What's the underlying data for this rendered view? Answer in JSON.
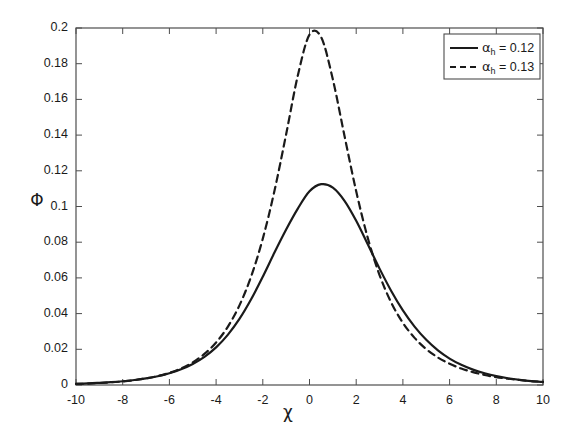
{
  "chart_data": {
    "type": "line",
    "title": "",
    "xlabel": "χ",
    "ylabel": "Φ",
    "xlim": [
      -10,
      10
    ],
    "ylim": [
      0,
      0.2
    ],
    "xticks": [
      -10,
      -8,
      -6,
      -4,
      -2,
      0,
      2,
      4,
      6,
      8,
      10
    ],
    "xtick_labels": [
      "-10",
      "-8",
      "-6",
      "-4",
      "-2",
      "0",
      "2",
      "4",
      "6",
      "8",
      "10"
    ],
    "yticks": [
      0,
      0.02,
      0.04,
      0.06,
      0.08,
      0.1,
      0.12,
      0.14,
      0.16,
      0.18,
      0.2
    ],
    "ytick_labels": [
      "0",
      "0.02",
      "0.04",
      "0.06",
      "0.08",
      "0.1",
      "0.12",
      "0.14",
      "0.16",
      "0.18",
      "0.2"
    ],
    "grid": false,
    "legend_position": "top-right",
    "line_color": "#1a1a1a",
    "series": [
      {
        "name": "α_h = 0.12",
        "style": "solid",
        "peak_x": 0.1,
        "peak_y": 0.113,
        "x": [
          -10,
          -9.5,
          -9,
          -8.5,
          -8,
          -7.5,
          -7,
          -6.5,
          -6,
          -5.5,
          -5,
          -4.5,
          -4,
          -3.5,
          -3,
          -2.5,
          -2,
          -1.5,
          -1,
          -0.5,
          0,
          0.5,
          1,
          1.5,
          2,
          2.5,
          3,
          3.5,
          4,
          4.5,
          5,
          5.5,
          6,
          6.5,
          7,
          7.5,
          8,
          8.5,
          9,
          9.5,
          10
        ],
        "y": [
          0.0007,
          0.0009,
          0.0012,
          0.0016,
          0.0021,
          0.0028,
          0.0037,
          0.0049,
          0.0066,
          0.0088,
          0.0118,
          0.0158,
          0.0211,
          0.0281,
          0.037,
          0.048,
          0.0607,
          0.0742,
          0.0871,
          0.0988,
          0.1085,
          0.1125,
          0.1106,
          0.1032,
          0.092,
          0.0787,
          0.0652,
          0.0527,
          0.0418,
          0.0327,
          0.0253,
          0.0194,
          0.0148,
          0.0113,
          0.0086,
          0.0066,
          0.005,
          0.0038,
          0.0029,
          0.0022,
          0.0017
        ]
      },
      {
        "name": "α_h = 0.13",
        "style": "dashed",
        "peak_x": 0.0,
        "peak_y": 0.196,
        "x": [
          -10,
          -9.5,
          -9,
          -8.5,
          -8,
          -7.5,
          -7,
          -6.5,
          -6,
          -5.5,
          -5,
          -4.5,
          -4,
          -3.5,
          -3,
          -2.5,
          -2,
          -1.5,
          -1,
          -0.5,
          0,
          0.5,
          1,
          1.5,
          2,
          2.5,
          3,
          3.5,
          4,
          4.5,
          5,
          5.5,
          6,
          6.5,
          7,
          7.5,
          8,
          8.5,
          9,
          9.5,
          10
        ],
        "y": [
          0.0006,
          0.0008,
          0.0011,
          0.0015,
          0.002,
          0.0027,
          0.0037,
          0.005,
          0.0068,
          0.0093,
          0.0127,
          0.0174,
          0.0238,
          0.0326,
          0.0446,
          0.0608,
          0.082,
          0.1088,
          0.1405,
          0.1734,
          0.1963,
          0.1948,
          0.1712,
          0.1395,
          0.1085,
          0.0822,
          0.0616,
          0.0462,
          0.0348,
          0.0264,
          0.0201,
          0.0154,
          0.0119,
          0.0092,
          0.0072,
          0.0056,
          0.0044,
          0.0035,
          0.0028,
          0.0022,
          0.0018
        ]
      }
    ]
  },
  "legend": {
    "entries": [
      {
        "symbol": "α",
        "subscript": "h",
        "equals": " = ",
        "value": "0.12",
        "style": "solid"
      },
      {
        "symbol": "α",
        "subscript": "h",
        "equals": " = ",
        "value": "0.13",
        "style": "dashed"
      }
    ]
  },
  "axes": {
    "y_label_text": "Φ",
    "x_label_text": "χ"
  }
}
